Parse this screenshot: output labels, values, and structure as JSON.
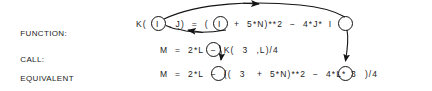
{
  "figure": {
    "kind": "statement-function-substitution-diagram",
    "background_color": "#ffffff",
    "ink_color": "#1c1c1c"
  },
  "rows": {
    "function": {
      "label": "FUNCTION:",
      "code_before_arg1": "K( ",
      "arg1": "I",
      "code_after_arg1": " , J)  =  ( ",
      "arg2": "I",
      "code_after_arg2": "  +  5*N)**2  −  4*J*",
      "arg3": "I",
      "code_tail": "",
      "full_text": "K( I , J) = ( I + 5*N)**2 - 4*J* I"
    },
    "call": {
      "label": "CALL:",
      "code_before_arg1": "M  =  2*L  −  K( ",
      "arg1": "3",
      "code_after_arg1": " ,L)/4",
      "full_text": "M = 2*L - K( 3 ,L)/4"
    },
    "equivalent": {
      "label_line1": "EQUIVALENT",
      "label_line2": "EXPRESSION:",
      "code_before_arg1": "M  =  2*L  −  (( ",
      "arg1": "3",
      "code_after_arg1": "  +  5*N)**2  −  4*L*",
      "arg2": "3",
      "code_tail": " )/4",
      "full_text": "M = 2*L - (( 3 + 5*N)**2 - 4*L* 3 )/4"
    }
  },
  "arrows": [
    {
      "name": "arrow-param-i-to-third-i",
      "from": "function-arg1-circle",
      "to": "function-arg3-circle",
      "direction": "right",
      "style": "long-curve-over-top"
    },
    {
      "name": "arrow-param-i-to-second-i",
      "from": "function-arg2-circle",
      "to": "function-arg1-circle",
      "direction": "left",
      "style": "shallow-curve-below-line"
    },
    {
      "name": "arrow-call-3-to-equivalent-3",
      "from": "call-arg1-circle",
      "to": "equivalent-arg1-circle",
      "direction": "down",
      "style": "short-vertical"
    },
    {
      "name": "arrow-function-i-to-equivalent-3",
      "from": "function-arg3-circle",
      "to": "equivalent-arg2-circle",
      "direction": "down",
      "style": "long-vertical"
    }
  ]
}
